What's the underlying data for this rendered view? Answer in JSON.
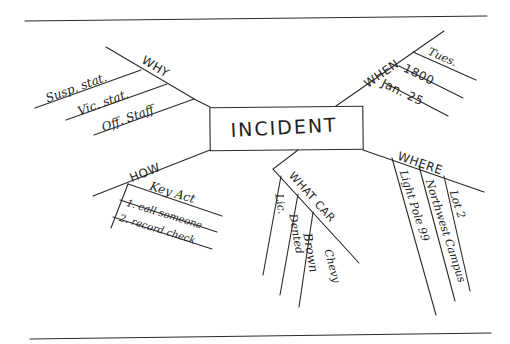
{
  "diagram": {
    "type": "fishbone-mind-map",
    "style": "hand-drawn",
    "center": {
      "label": "INCIDENT"
    },
    "branches": [
      {
        "id": "why",
        "label": "WHY",
        "items": [
          "Susp. stat.",
          "Vic. stat.",
          "Off. Staff"
        ]
      },
      {
        "id": "when",
        "label": "WHEN",
        "items": [
          "Tues.",
          "1800",
          "Jan. 25"
        ]
      },
      {
        "id": "how",
        "label": "HOW",
        "items": [
          "Key Act",
          "1. call someone",
          "2. record check"
        ]
      },
      {
        "id": "what",
        "label": "WHAT CAR",
        "items": [
          "Lic.",
          "Dented",
          "Brown",
          "Chevy"
        ]
      },
      {
        "id": "where",
        "label": "WHERE",
        "items": [
          "Light Pole 99",
          "Northwest Campus",
          "Lot 2"
        ]
      }
    ],
    "colors": {
      "ink": "#1e1e1e",
      "paper": "#ffffff"
    }
  }
}
